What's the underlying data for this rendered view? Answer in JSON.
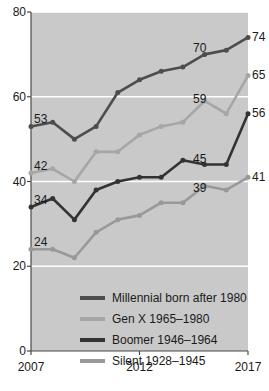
{
  "chart_data": {
    "type": "line",
    "title": "",
    "xlabel": "",
    "ylabel": "",
    "x": [
      2007,
      2008,
      2009,
      2010,
      2011,
      2012,
      2013,
      2014,
      2015,
      2016,
      2017
    ],
    "xlim": [
      2007,
      2017
    ],
    "ylim": [
      0,
      80
    ],
    "yticks": [
      0,
      20,
      40,
      60,
      80
    ],
    "xticks": [
      2007,
      2012,
      2017
    ],
    "grid": true,
    "legend_position": "inside-bottom",
    "series": [
      {
        "name": "Millennial born after 1980",
        "color": "#4d4d4d",
        "values": [
          53,
          54,
          50,
          53,
          61,
          64,
          66,
          67,
          70,
          71,
          74
        ],
        "start_label": "53",
        "mid_label": "70",
        "end_label": "74"
      },
      {
        "name": "Gen X 1965–1980",
        "color": "#a6a6a6",
        "values": [
          42,
          43,
          40,
          47,
          47,
          51,
          53,
          54,
          59,
          56,
          65
        ],
        "start_label": "42",
        "mid_label": "59",
        "end_label": "65"
      },
      {
        "name": "Boomer 1946–1964",
        "color": "#333333",
        "values": [
          34,
          36,
          31,
          38,
          40,
          41,
          41,
          45,
          44,
          44,
          56
        ],
        "start_label": "34",
        "mid_label": "45",
        "end_label": "56"
      },
      {
        "name": "Silent 1928–1945",
        "color": "#999999",
        "values": [
          24,
          24,
          22,
          28,
          31,
          32,
          35,
          35,
          39,
          38,
          41
        ],
        "start_label": "24",
        "mid_label": "39",
        "end_label": "41"
      }
    ]
  },
  "axes": {
    "y_labels": [
      "80",
      "60",
      "40",
      "20",
      "0"
    ],
    "x_labels": [
      "2007",
      "2012",
      "2017"
    ]
  },
  "legend": {
    "items": [
      {
        "label": "Millennial born after 1980",
        "color": "#4d4d4d"
      },
      {
        "label": "Gen X 1965–1980",
        "color": "#a6a6a6"
      },
      {
        "label": "Boomer 1946–1964",
        "color": "#333333"
      },
      {
        "label": "Silent 1928–1945",
        "color": "#999999"
      }
    ]
  },
  "annotations": {
    "start": [
      "53",
      "42",
      "34",
      "24"
    ],
    "mid": [
      "70",
      "59",
      "45",
      "39"
    ],
    "end": [
      "74",
      "65",
      "56",
      "41"
    ]
  }
}
